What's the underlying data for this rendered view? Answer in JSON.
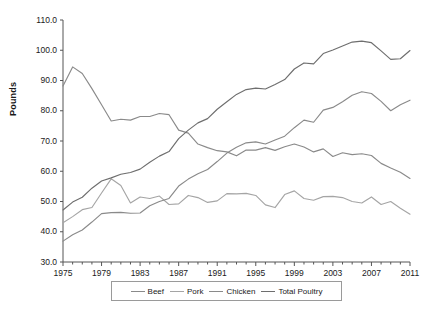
{
  "chart_data": {
    "type": "line",
    "title": "",
    "xlabel": "",
    "ylabel": "Pounds",
    "xlim": [
      1975,
      2011
    ],
    "ylim": [
      30.0,
      110.0
    ],
    "grid": false,
    "legend_position": "bottom-center",
    "x": [
      1975,
      1976,
      1977,
      1978,
      1979,
      1980,
      1981,
      1982,
      1983,
      1984,
      1985,
      1986,
      1987,
      1988,
      1989,
      1990,
      1991,
      1992,
      1993,
      1994,
      1995,
      1996,
      1997,
      1998,
      1999,
      2000,
      2001,
      2002,
      2003,
      2004,
      2005,
      2006,
      2007,
      2008,
      2009,
      2010,
      2011
    ],
    "xtick_labels": [
      "1975",
      "1979",
      "1983",
      "1987",
      "1991",
      "1995",
      "1999",
      "2003",
      "2007",
      "2011"
    ],
    "xtick_values": [
      1975,
      1979,
      1983,
      1987,
      1991,
      1995,
      1999,
      2003,
      2007,
      2011
    ],
    "ytick_labels": [
      "30.0",
      "40.0",
      "50.0",
      "60.0",
      "70.0",
      "80.0",
      "90.0",
      "100.0",
      "110.0"
    ],
    "ytick_values": [
      30.0,
      40.0,
      50.0,
      60.0,
      70.0,
      80.0,
      90.0,
      100.0,
      110.0
    ],
    "series": [
      {
        "name": "Beef",
        "color": "#8a8a8a",
        "values": [
          88.2,
          94.5,
          92.3,
          87.3,
          82.0,
          76.6,
          77.2,
          76.9,
          78.1,
          78.1,
          79.1,
          78.7,
          73.6,
          72.6,
          69.0,
          67.8,
          66.8,
          66.4,
          65.1,
          67.0,
          67.0,
          67.8,
          66.9,
          68.1,
          69.0,
          68.0,
          66.4,
          67.4,
          64.9,
          66.1,
          65.5,
          65.8,
          65.2,
          62.6,
          61.1,
          59.7,
          57.6
        ]
      },
      {
        "name": "Pork",
        "color": "#a5a5a5",
        "values": [
          43.0,
          45.0,
          47.3,
          48.0,
          52.8,
          57.5,
          55.3,
          49.5,
          51.5,
          51.0,
          51.8,
          49.0,
          49.2,
          52.0,
          51.3,
          49.7,
          50.2,
          52.6,
          52.5,
          52.7,
          52.0,
          48.9,
          48.0,
          52.3,
          53.5,
          51.0,
          50.4,
          51.6,
          51.7,
          51.3,
          50.0,
          49.5,
          51.5,
          49.0,
          50.0,
          47.8,
          45.8
        ]
      },
      {
        "name": "Chicken",
        "color": "#8a8a8a",
        "values": [
          36.9,
          39.0,
          40.6,
          43.2,
          46.0,
          46.3,
          46.4,
          46.1,
          46.2,
          48.6,
          50.0,
          51.0,
          55.1,
          57.4,
          59.2,
          60.6,
          63.2,
          66.0,
          67.9,
          69.4,
          69.7,
          69.0,
          70.3,
          71.6,
          74.4,
          76.9,
          76.2,
          80.2,
          81.1,
          83.0,
          85.1,
          86.3,
          85.7,
          83.1,
          80.0,
          82.0,
          83.5
        ]
      },
      {
        "name": "Total Poultry",
        "color": "#6e6e6e",
        "values": [
          47.2,
          49.8,
          51.4,
          54.4,
          56.8,
          57.8,
          59.0,
          59.6,
          60.7,
          63.0,
          65.0,
          66.5,
          70.8,
          73.6,
          76.0,
          77.4,
          80.5,
          83.0,
          85.4,
          87.0,
          87.5,
          87.2,
          88.7,
          90.3,
          93.8,
          95.8,
          95.5,
          98.9,
          100.1,
          101.4,
          102.7,
          103.0,
          102.5,
          99.8,
          97.0,
          97.2,
          99.9
        ]
      }
    ]
  },
  "axis": {
    "ylabel": "Pounds"
  },
  "legend": {
    "items": [
      {
        "label": "Beef",
        "color": "#8a8a8a"
      },
      {
        "label": "Pork",
        "color": "#a5a5a5"
      },
      {
        "label": "Chicken",
        "color": "#8a8a8a"
      },
      {
        "label": "Total Poultry",
        "color": "#6e6e6e"
      }
    ]
  }
}
